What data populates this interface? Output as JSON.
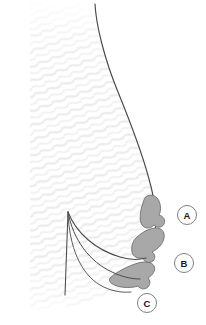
{
  "figure": {
    "background_color": "#ffffff",
    "outline_color": "#4a4a4a",
    "body_fill_color": "#fefefe",
    "hatch_color": "#ededed",
    "lobe_fill_color": "#a8a8a8",
    "lobe_stroke_color": "#6e6e6e",
    "label_circle_stroke_color": "#808080",
    "label_text_color": "#1a1a1a"
  },
  "labels": [
    {
      "id": "A",
      "text": "A",
      "cx": 187,
      "cy": 215,
      "r": 9.5
    },
    {
      "id": "B",
      "text": "B",
      "cx": 184,
      "cy": 263,
      "r": 9.5
    },
    {
      "id": "C",
      "text": "C",
      "cx": 147,
      "cy": 303,
      "r": 9.5
    }
  ],
  "regions": [
    {
      "id": "lobe-a",
      "label_ref": "A",
      "description": "upper lobular tissue mass"
    },
    {
      "id": "lobe-b",
      "label_ref": "B",
      "description": "middle lobular tissue mass"
    },
    {
      "id": "lobe-c",
      "label_ref": "C",
      "description": "lower lobular tissue mass"
    }
  ],
  "fold_lines": [
    {
      "id": "fold-1",
      "description": "upper crease curve"
    },
    {
      "id": "fold-2",
      "description": "middle crease curve"
    },
    {
      "id": "fold-3",
      "description": "lower crease curve"
    }
  ]
}
